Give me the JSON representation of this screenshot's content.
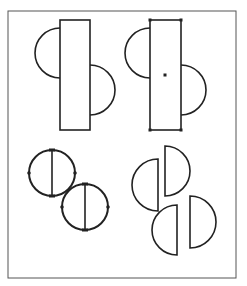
{
  "diagram": {
    "frame": {
      "x": 8,
      "y": 11,
      "width": 228,
      "height": 267,
      "stroke": "#555555"
    },
    "stroke_color": "#222222",
    "shapes": {
      "rect_with_semicircles_plain": {
        "rect": {
          "x": 60,
          "y": 20,
          "w": 30,
          "h": 110
        },
        "left_semicircle": {
          "cx": 60,
          "cy": 53,
          "r": 25
        },
        "right_semicircle": {
          "cx": 90,
          "cy": 90,
          "r": 25
        }
      },
      "rect_with_semicircles_selected": {
        "rect": {
          "x": 150,
          "y": 20,
          "w": 31,
          "h": 110
        },
        "left_semicircle": {
          "cx": 150,
          "cy": 53,
          "r": 25
        },
        "right_semicircle": {
          "cx": 181,
          "cy": 90,
          "r": 25
        },
        "center_handle": {
          "x": 165,
          "y": 75
        }
      },
      "circle_1": {
        "cx": 52,
        "cy": 173,
        "r": 23
      },
      "circle_2": {
        "cx": 85,
        "cy": 207,
        "r": 23
      },
      "half_discs": [
        {
          "flat_x": 158,
          "cy": 185,
          "r": 26,
          "facing": "left"
        },
        {
          "flat_x": 165,
          "cy": 171,
          "r": 25,
          "facing": "right"
        },
        {
          "flat_x": 177,
          "cy": 230,
          "r": 25,
          "facing": "left"
        },
        {
          "flat_x": 190,
          "cy": 222,
          "r": 26,
          "facing": "right"
        }
      ]
    }
  }
}
